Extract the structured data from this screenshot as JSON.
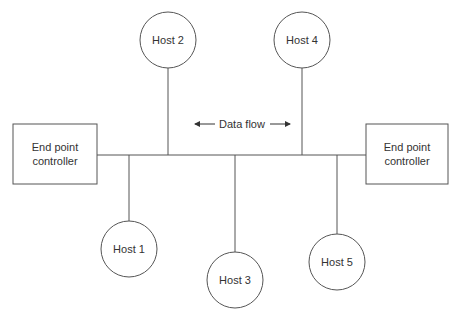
{
  "diagram": {
    "type": "bus-topology",
    "colors": {
      "stroke": "#555555",
      "text": "#333333",
      "background": "#ffffff"
    },
    "controllers": [
      {
        "id": "left",
        "line1": "End point",
        "line2": "controller"
      },
      {
        "id": "right",
        "line1": "End point",
        "line2": "controller"
      }
    ],
    "hosts": [
      {
        "id": "host1",
        "label": "Host 1"
      },
      {
        "id": "host2",
        "label": "Host 2"
      },
      {
        "id": "host3",
        "label": "Host 3"
      },
      {
        "id": "host4",
        "label": "Host 4"
      },
      {
        "id": "host5",
        "label": "Host 5"
      }
    ],
    "data_flow": {
      "label": "Data flow",
      "direction": "bidirectional"
    }
  }
}
